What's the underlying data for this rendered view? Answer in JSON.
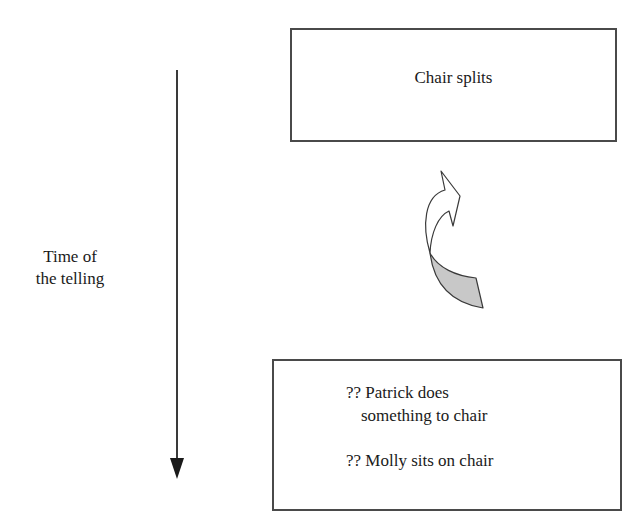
{
  "diagram": {
    "timeline": {
      "label_line1": "Time of",
      "label_line2": "the telling",
      "direction": "down"
    },
    "top_box": {
      "text": "Chair splits"
    },
    "bottom_box": {
      "lines": [
        "?? Patrick does",
        "something to chair",
        "?? Molly sits on chair"
      ]
    },
    "curved_arrow": {
      "direction": "upward",
      "tail_fill": "#c8c8c8",
      "head_fill": "#ffffff"
    },
    "colors": {
      "stroke": "#3a3a3a",
      "box_border": "#4a4a4a",
      "background": "#ffffff"
    }
  }
}
